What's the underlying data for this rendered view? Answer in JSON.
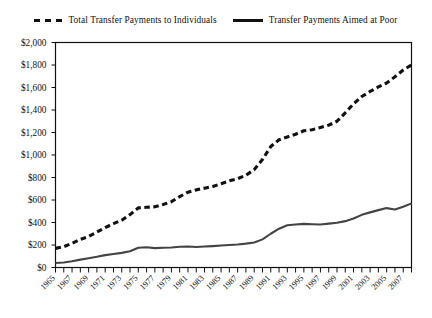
{
  "legend": {
    "entries": [
      {
        "label": "Total Transfer Payments to Individuals",
        "style": "dashed",
        "color": "#111111"
      },
      {
        "label": "Transfer Payments Aimed at Poor",
        "style": "solid",
        "color": "#111111"
      }
    ]
  },
  "chart_data": {
    "type": "line",
    "title": "",
    "subtitle": "",
    "xlabel": "",
    "ylabel": "",
    "xlim": [
      1965,
      2008
    ],
    "ylim": [
      0,
      2000
    ],
    "grid": false,
    "legend_position": "top-center",
    "y_ticks": [
      0,
      200,
      400,
      600,
      800,
      1000,
      1200,
      1400,
      1600,
      1800,
      2000
    ],
    "y_tick_labels": [
      "$0",
      "$200",
      "$400",
      "$600",
      "$800",
      "$1,000",
      "$1,200",
      "$1,400",
      "$1,600",
      "$1,800",
      "$2,000"
    ],
    "x_ticks": [
      1965,
      1966,
      1967,
      1968,
      1969,
      1970,
      1971,
      1972,
      1973,
      1974,
      1975,
      1976,
      1977,
      1978,
      1979,
      1980,
      1981,
      1982,
      1983,
      1984,
      1985,
      1986,
      1987,
      1988,
      1989,
      1990,
      1991,
      1992,
      1993,
      1994,
      1995,
      1996,
      1997,
      1998,
      1999,
      2000,
      2001,
      2002,
      2003,
      2004,
      2005,
      2006,
      2007,
      2008
    ],
    "x_tick_labels": [
      "1965",
      "1967",
      "1969",
      "1971",
      "1973",
      "1975",
      "1977",
      "1979",
      "1981",
      "1983",
      "1985",
      "1987",
      "1989",
      "1991",
      "1993",
      "1995",
      "1997",
      "1999",
      "2001",
      "2003",
      "2005",
      "2007"
    ],
    "x_tick_label_years": [
      1965,
      1967,
      1969,
      1971,
      1973,
      1975,
      1977,
      1979,
      1981,
      1983,
      1985,
      1987,
      1989,
      1991,
      1993,
      1995,
      1997,
      1999,
      2001,
      2003,
      2005,
      2007
    ],
    "x": [
      1965,
      1966,
      1967,
      1968,
      1969,
      1970,
      1971,
      1972,
      1973,
      1974,
      1975,
      1976,
      1977,
      1978,
      1979,
      1980,
      1981,
      1982,
      1983,
      1984,
      1985,
      1986,
      1987,
      1988,
      1989,
      1990,
      1991,
      1992,
      1993,
      1994,
      1995,
      1996,
      1997,
      1998,
      1999,
      2000,
      2001,
      2002,
      2003,
      2004,
      2005,
      2006,
      2007,
      2008
    ],
    "series": [
      {
        "name": "Total Transfer Payments to Individuals",
        "style": "dashed",
        "color": "#111111",
        "values": [
          170,
          185,
          215,
          250,
          275,
          315,
          355,
          390,
          420,
          470,
          530,
          535,
          540,
          560,
          585,
          630,
          670,
          690,
          705,
          720,
          745,
          770,
          790,
          820,
          870,
          960,
          1075,
          1135,
          1160,
          1185,
          1215,
          1225,
          1245,
          1265,
          1300,
          1375,
          1455,
          1520,
          1565,
          1605,
          1640,
          1695,
          1755,
          1800
        ]
      },
      {
        "name": "Transfer Payments Aimed at Poor",
        "style": "solid",
        "color": "#444444",
        "values": [
          40,
          45,
          55,
          70,
          82,
          95,
          110,
          120,
          130,
          145,
          175,
          180,
          172,
          175,
          178,
          185,
          186,
          182,
          186,
          190,
          195,
          200,
          205,
          212,
          222,
          250,
          300,
          345,
          375,
          382,
          388,
          385,
          382,
          390,
          398,
          412,
          435,
          468,
          490,
          510,
          528,
          515,
          540,
          570
        ]
      }
    ]
  }
}
